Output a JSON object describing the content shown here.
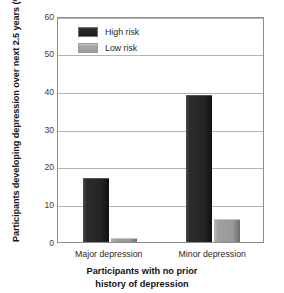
{
  "chart_data": {
    "type": "bar",
    "title": "",
    "subtitle": "",
    "categories": [
      "Major depression",
      "Minor depression"
    ],
    "series": [
      {
        "name": "High risk",
        "values": [
          17,
          39
        ],
        "color": "#262626"
      },
      {
        "name": "Low risk",
        "values": [
          1,
          6
        ],
        "color": "#9b9b9b"
      }
    ],
    "xlabel_line1": "Participants with no prior",
    "xlabel_line2": "history of depression",
    "ylabel": "Participants developing depression over next 2.5 years (%)",
    "ylim": [
      0,
      60
    ],
    "yticks": [
      0,
      10,
      20,
      30,
      40,
      50,
      60
    ],
    "ytick_labels": [
      "0",
      "10",
      "20",
      "30",
      "40",
      "50",
      "60"
    ],
    "grid": true,
    "grid_axis": "y",
    "legend_position": "top-left-inside",
    "legend_border": false,
    "frame": true
  },
  "colors": {
    "high_risk": "#262626",
    "low_risk": "#9b9b9b",
    "grid": "#b4b4b4",
    "frame": "#8d8d8d",
    "background": "#ffffff",
    "text": "#1a1a1a"
  }
}
